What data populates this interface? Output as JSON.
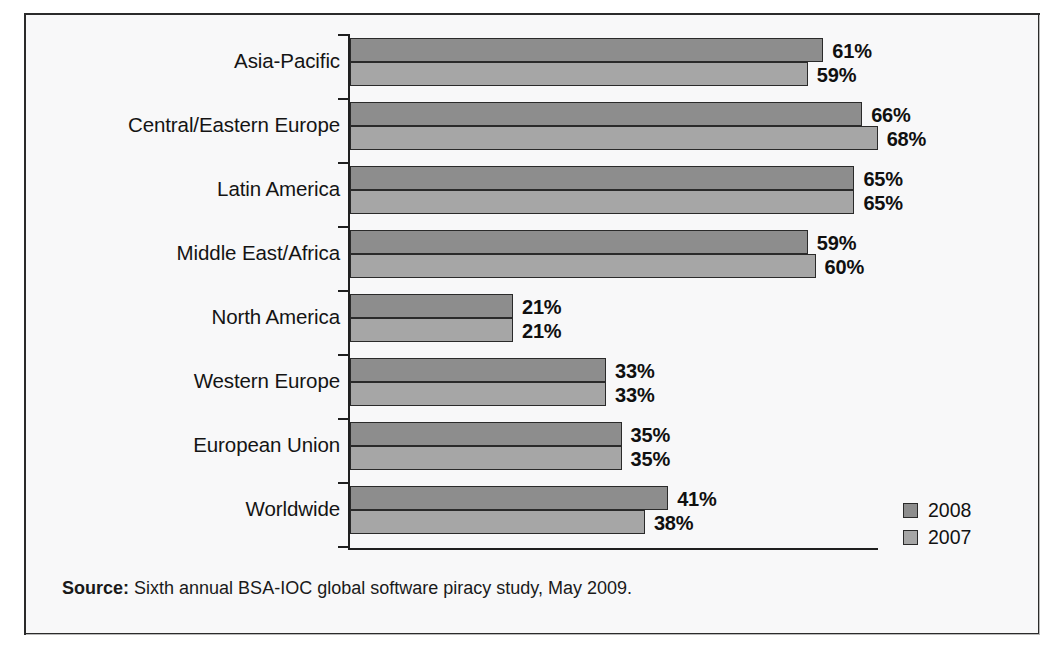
{
  "chart_data": {
    "type": "bar",
    "orientation": "horizontal",
    "title": "",
    "xlabel": "",
    "ylabel": "",
    "xlim": [
      0,
      70
    ],
    "grid": false,
    "legend_position": "bottom-right",
    "value_suffix": "%",
    "categories": [
      "Asia-Pacific",
      "Central/Eastern Europe",
      "Latin America",
      "Middle East/Africa",
      "North America",
      "Western Europe",
      "European Union",
      "Worldwide"
    ],
    "series": [
      {
        "name": "2008",
        "color": "#8d8d8d",
        "values": [
          61,
          66,
          65,
          59,
          21,
          33,
          35,
          41
        ],
        "labels": [
          "61%",
          "66%",
          "65%",
          "59%",
          "21%",
          "33%",
          "35%",
          "41%"
        ]
      },
      {
        "name": "2007",
        "color": "#a6a6a6",
        "values": [
          59,
          68,
          65,
          60,
          21,
          33,
          35,
          38
        ],
        "labels": [
          "59%",
          "68%",
          "65%",
          "60%",
          "21%",
          "33%",
          "35%",
          "38%"
        ]
      }
    ]
  },
  "legend": {
    "items": [
      {
        "label": "2008",
        "color": "#8d8d8d"
      },
      {
        "label": "2007",
        "color": "#a6a6a6"
      }
    ]
  },
  "source": {
    "prefix": "Source:",
    "text": "Sixth annual BSA-IOC global software piracy study, May 2009."
  }
}
